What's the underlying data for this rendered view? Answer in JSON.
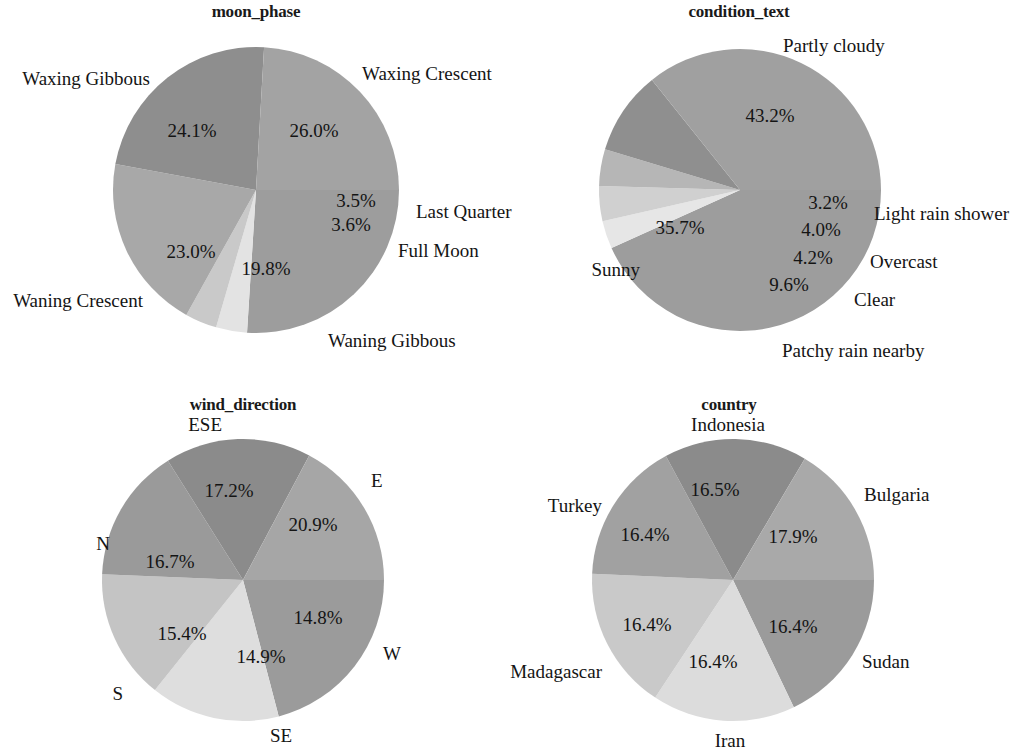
{
  "figure": {
    "background": "#ffffff",
    "width": 1023,
    "height": 749,
    "panel_count": 4
  },
  "chart_data": [
    {
      "type": "pie",
      "title": "moon_phase",
      "xlabel": "",
      "ylabel": "",
      "legend": "none",
      "labels_position": "outside",
      "categories": [
        "Waxing Crescent",
        "Last Quarter",
        "Full Moon",
        "Waning Gibbous",
        "Waning Crescent",
        "Waxing Gibbous"
      ],
      "values": [
        26.0,
        3.5,
        3.6,
        19.8,
        23.0,
        24.1
      ],
      "value_labels": [
        "26.0%",
        "3.5%",
        "3.6%",
        "19.8%",
        "23.0%",
        "24.1%"
      ],
      "colors": [
        "#9d9d9d",
        "#e3e3e3",
        "#c9c9c9",
        "#a8a8a8",
        "#8e8e8e",
        "#a3a3a3"
      ],
      "start_angle": 0,
      "direction": "clockwise",
      "center": {
        "x": 256,
        "y": 190
      },
      "radius": 143,
      "title_x": 256,
      "title_y": 2,
      "cat_label_positions": [
        {
          "x": 362,
          "y": 74,
          "anchor": "start"
        },
        {
          "x": 416,
          "y": 212,
          "anchor": "start"
        },
        {
          "x": 398,
          "y": 251,
          "anchor": "start"
        },
        {
          "x": 328,
          "y": 341,
          "anchor": "start"
        },
        {
          "x": 143,
          "y": 301,
          "anchor": "end"
        },
        {
          "x": 150,
          "y": 79,
          "anchor": "end"
        }
      ],
      "pct_label_positions": [
        {
          "x": 314,
          "y": 131
        },
        {
          "x": 356,
          "y": 201
        },
        {
          "x": 351,
          "y": 225
        },
        {
          "x": 266,
          "y": 269
        },
        {
          "x": 191,
          "y": 252
        },
        {
          "x": 192,
          "y": 131
        }
      ]
    },
    {
      "type": "pie",
      "title": "condition_text",
      "xlabel": "",
      "ylabel": "",
      "legend": "none",
      "labels_position": "outside",
      "categories": [
        "Partly cloudy",
        "Light rain shower",
        "Overcast",
        "Clear",
        "Patchy rain nearby",
        "Sunny"
      ],
      "values": [
        43.2,
        3.2,
        4.0,
        4.2,
        9.6,
        35.7
      ],
      "value_labels": [
        "43.2%",
        "3.2%",
        "4.0%",
        "4.2%",
        "9.6%",
        "35.7%"
      ],
      "colors": [
        "#9d9d9d",
        "#e6e6e6",
        "#d0d0d0",
        "#b6b6b6",
        "#8f8f8f",
        "#a0a0a0"
      ],
      "start_angle": 0,
      "direction": "clockwise",
      "center": {
        "x": 740,
        "y": 190
      },
      "radius": 141,
      "title_x": 739,
      "title_y": 2,
      "cat_label_positions": [
        {
          "x": 783,
          "y": 46,
          "anchor": "start"
        },
        {
          "x": 874,
          "y": 214,
          "anchor": "start"
        },
        {
          "x": 870,
          "y": 262,
          "anchor": "start"
        },
        {
          "x": 854,
          "y": 300,
          "anchor": "start"
        },
        {
          "x": 782,
          "y": 351,
          "anchor": "start"
        },
        {
          "x": 640,
          "y": 270,
          "anchor": "end"
        }
      ],
      "pct_label_positions": [
        {
          "x": 770,
          "y": 116
        },
        {
          "x": 828,
          "y": 203
        },
        {
          "x": 821,
          "y": 230
        },
        {
          "x": 813,
          "y": 258
        },
        {
          "x": 789,
          "y": 285
        },
        {
          "x": 680,
          "y": 228
        }
      ]
    },
    {
      "type": "pie",
      "title": "wind_direction",
      "xlabel": "",
      "ylabel": "",
      "legend": "none",
      "labels_position": "outside",
      "categories": [
        "E",
        "W",
        "SE",
        "S",
        "N",
        "ESE"
      ],
      "values": [
        20.9,
        14.8,
        14.9,
        15.4,
        16.7,
        17.2
      ],
      "value_labels": [
        "20.9%",
        "14.8%",
        "14.9%",
        "15.4%",
        "16.7%",
        "17.2%"
      ],
      "colors": [
        "#9b9b9b",
        "#dedede",
        "#c4c4c4",
        "#9a9a9a",
        "#8b8b8b",
        "#a6a6a6"
      ],
      "start_angle": 0,
      "direction": "clockwise",
      "center": {
        "x": 243,
        "y": 580
      },
      "radius": 141,
      "title_x": 243,
      "title_y": 395,
      "cat_label_positions": [
        {
          "x": 371,
          "y": 481,
          "anchor": "start"
        },
        {
          "x": 383,
          "y": 654,
          "anchor": "start"
        },
        {
          "x": 270,
          "y": 736,
          "anchor": "start"
        },
        {
          "x": 123,
          "y": 694,
          "anchor": "end"
        },
        {
          "x": 110,
          "y": 544,
          "anchor": "end"
        },
        {
          "x": 222,
          "y": 425,
          "anchor": "end"
        }
      ],
      "pct_label_positions": [
        {
          "x": 313,
          "y": 525
        },
        {
          "x": 318,
          "y": 618
        },
        {
          "x": 261,
          "y": 657
        },
        {
          "x": 182,
          "y": 634
        },
        {
          "x": 170,
          "y": 562
        },
        {
          "x": 229,
          "y": 491
        }
      ]
    },
    {
      "type": "pie",
      "title": "country",
      "xlabel": "",
      "ylabel": "",
      "legend": "none",
      "labels_position": "outside",
      "categories": [
        "Bulgaria",
        "Sudan",
        "Iran",
        "Madagascar",
        "Turkey",
        "Indonesia"
      ],
      "values": [
        17.9,
        16.4,
        16.4,
        16.4,
        16.4,
        16.5
      ],
      "value_labels": [
        "17.9%",
        "16.4%",
        "16.4%",
        "16.4%",
        "16.4%",
        "16.5%"
      ],
      "colors": [
        "#9b9b9b",
        "#dcdcdc",
        "#c9c9c9",
        "#a1a1a1",
        "#8b8b8b",
        "#a9a9a9"
      ],
      "start_angle": 0,
      "direction": "clockwise",
      "center": {
        "x": 733,
        "y": 580
      },
      "radius": 141,
      "title_x": 729,
      "title_y": 395,
      "cat_label_positions": [
        {
          "x": 864,
          "y": 495,
          "anchor": "start"
        },
        {
          "x": 862,
          "y": 662,
          "anchor": "start"
        },
        {
          "x": 730,
          "y": 741,
          "anchor": "mid"
        },
        {
          "x": 602,
          "y": 672,
          "anchor": "end"
        },
        {
          "x": 602,
          "y": 506,
          "anchor": "end"
        },
        {
          "x": 728,
          "y": 425,
          "anchor": "mid"
        }
      ],
      "pct_label_positions": [
        {
          "x": 793,
          "y": 537
        },
        {
          "x": 793,
          "y": 627
        },
        {
          "x": 713,
          "y": 662
        },
        {
          "x": 647,
          "y": 625
        },
        {
          "x": 645,
          "y": 535
        },
        {
          "x": 715,
          "y": 490
        }
      ]
    }
  ]
}
